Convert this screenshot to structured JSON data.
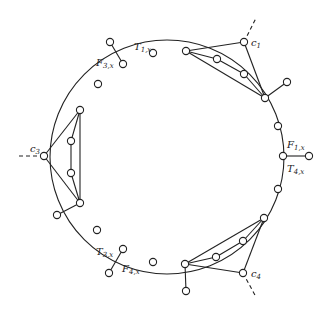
{
  "diagram": {
    "type": "gadget-ring",
    "stroke_color": "#222222",
    "background": "#ffffff",
    "ring": {
      "cx": 167,
      "cy": 157,
      "r": 117
    },
    "labels": [
      {
        "id": "T1x",
        "main": "T",
        "sub": "1,x",
        "x": 134,
        "y": 50
      },
      {
        "id": "F3x",
        "main": "F",
        "sub": "3,x",
        "x": 96,
        "y": 66
      },
      {
        "id": "c1",
        "main": "c",
        "sub": "1",
        "x": 251,
        "y": 46
      },
      {
        "id": "F1x",
        "main": "F",
        "sub": "1,x",
        "x": 287,
        "y": 148
      },
      {
        "id": "T4x",
        "main": "T",
        "sub": "4,x",
        "x": 287,
        "y": 172
      },
      {
        "id": "c3",
        "main": "c",
        "sub": "3",
        "x": 30,
        "y": 152
      },
      {
        "id": "T3x",
        "main": "T",
        "sub": "3,x",
        "x": 96,
        "y": 255
      },
      {
        "id": "F4x",
        "main": "F",
        "sub": "4,x",
        "x": 122,
        "y": 272
      },
      {
        "id": "c4",
        "main": "c",
        "sub": "4",
        "x": 251,
        "y": 277
      }
    ],
    "nodes": [
      {
        "id": "n_F3x",
        "x": 123,
        "y": 64
      },
      {
        "id": "p_F3x",
        "x": 110,
        "y": 42
      },
      {
        "id": "n_T1x",
        "x": 153,
        "y": 53
      },
      {
        "id": "n_top_hub",
        "x": 186,
        "y": 51
      },
      {
        "id": "c1",
        "x": 244,
        "y": 42
      },
      {
        "id": "c1_in1",
        "x": 217,
        "y": 59
      },
      {
        "id": "c1_in2",
        "x": 244,
        "y": 74
      },
      {
        "id": "n_right_hub_top",
        "x": 265,
        "y": 98
      },
      {
        "id": "p_right_hub_top",
        "x": 287,
        "y": 82
      },
      {
        "id": "n_r1",
        "x": 278,
        "y": 126
      },
      {
        "id": "n_F1x",
        "x": 283,
        "y": 156
      },
      {
        "id": "p_F1x",
        "x": 309,
        "y": 156
      },
      {
        "id": "n_r2",
        "x": 278,
        "y": 189
      },
      {
        "id": "n_right_hub_bot",
        "x": 264,
        "y": 218
      },
      {
        "id": "c4_in1",
        "x": 243,
        "y": 241
      },
      {
        "id": "c4_in2",
        "x": 216,
        "y": 257
      },
      {
        "id": "n_bot_hub",
        "x": 185,
        "y": 264
      },
      {
        "id": "c4",
        "x": 243,
        "y": 273
      },
      {
        "id": "p_bot_hub",
        "x": 186,
        "y": 291
      },
      {
        "id": "n_b1",
        "x": 153,
        "y": 262
      },
      {
        "id": "n_T3x",
        "x": 123,
        "y": 249
      },
      {
        "id": "p_T3x",
        "x": 109,
        "y": 273
      },
      {
        "id": "n_l1",
        "x": 97,
        "y": 230
      },
      {
        "id": "n_left_hub_bot",
        "x": 80,
        "y": 203
      },
      {
        "id": "p_left_hub_bot",
        "x": 57,
        "y": 215
      },
      {
        "id": "c3_in2",
        "x": 71,
        "y": 173
      },
      {
        "id": "c3",
        "x": 44,
        "y": 156
      },
      {
        "id": "c3_in1",
        "x": 71,
        "y": 141
      },
      {
        "id": "n_left_hub_top",
        "x": 80,
        "y": 110
      },
      {
        "id": "n_l2",
        "x": 98,
        "y": 84
      }
    ],
    "edges": [
      [
        "n_F3x",
        "p_F3x"
      ],
      [
        "n_top_hub",
        "c1"
      ],
      [
        "c1",
        "n_right_hub_top"
      ],
      [
        "n_top_hub",
        "c1_in1"
      ],
      [
        "c1_in1",
        "c1_in2"
      ],
      [
        "c1_in2",
        "n_right_hub_top"
      ],
      [
        "n_top_hub",
        "n_right_hub_top"
      ],
      [
        "n_right_hub_top",
        "p_right_hub_top"
      ],
      [
        "n_F1x",
        "p_F1x"
      ],
      [
        "n_right_hub_bot",
        "c4"
      ],
      [
        "c4",
        "n_bot_hub"
      ],
      [
        "n_right_hub_bot",
        "c4_in1"
      ],
      [
        "c4_in1",
        "c4_in2"
      ],
      [
        "c4_in2",
        "n_bot_hub"
      ],
      [
        "n_right_hub_bot",
        "n_bot_hub"
      ],
      [
        "n_bot_hub",
        "p_bot_hub"
      ],
      [
        "n_T3x",
        "p_T3x"
      ],
      [
        "n_left_hub_bot",
        "p_left_hub_bot"
      ],
      [
        "n_left_hub_top",
        "c3"
      ],
      [
        "c3",
        "n_left_hub_bot"
      ],
      [
        "n_left_hub_top",
        "c3_in1"
      ],
      [
        "c3_in1",
        "c3_in2"
      ],
      [
        "c3_in2",
        "n_left_hub_bot"
      ],
      [
        "n_left_hub_top",
        "n_left_hub_bot"
      ]
    ],
    "dashed_edges": [
      {
        "from": "c1",
        "x2": 256,
        "y2": 18
      },
      {
        "from": "c3",
        "x2": 18,
        "y2": 156
      },
      {
        "from": "c4",
        "x2": 256,
        "y2": 297
      }
    ]
  }
}
